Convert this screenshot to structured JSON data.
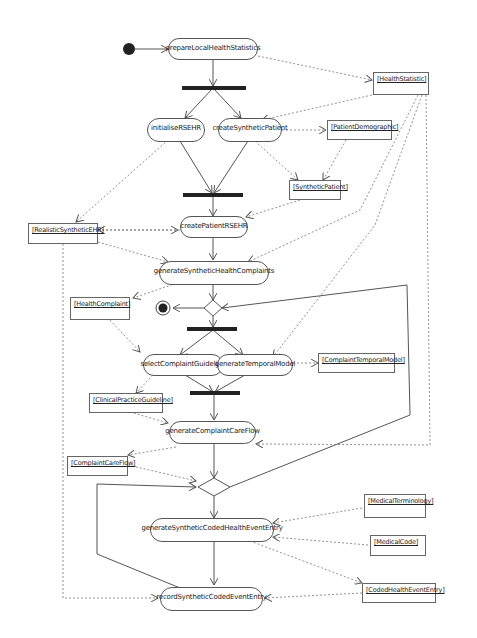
{
  "diagram": {
    "type": "UML activity diagram",
    "actions": [
      {
        "id": "prepareLocalHealthStatistics",
        "label": "prepareLocalHealthStatistics"
      },
      {
        "id": "initialiseRSEHR",
        "label": "initialiseRSEHR"
      },
      {
        "id": "createSyntheticPatient",
        "label": "createSyntheticPatient"
      },
      {
        "id": "createPatientRSEHR",
        "label": "createPatientRSEHR"
      },
      {
        "id": "generateSyntheticHealthComplaints",
        "label": "generateSyntheticHealthComplaints"
      },
      {
        "id": "selectComplaintGuideline",
        "label": "selectComplaintGuideline"
      },
      {
        "id": "generateTemporalModel",
        "label": "generateTemporalModel"
      },
      {
        "id": "generateComplaintCareFlow",
        "label": "generateComplaintCareFlow"
      },
      {
        "id": "generateSyntheticCodedHealthEventEntry",
        "label": "generateSyntheticCodedHealthEventEntry"
      },
      {
        "id": "recordSyntheticCodedEventEntry",
        "label": "recordSyntheticCodedEventEntry"
      }
    ],
    "objects": [
      {
        "id": "HealthStatistic",
        "label": "[HealthStatistic]"
      },
      {
        "id": "PatientDemographic",
        "label": "[PatientDemographic]"
      },
      {
        "id": "SyntheticPatient",
        "label": "[SyntheticPatient]"
      },
      {
        "id": "RealisticSyntheticEHR",
        "label": "[RealisticSyntheticEHR]"
      },
      {
        "id": "HealthComplaint",
        "label": "[HealthComplaint]"
      },
      {
        "id": "ComplaintTemporalModel",
        "label": "[ComplaintTemporalModel]"
      },
      {
        "id": "ClinicalPracticeGuideline",
        "label": "[ClinicalPracticeGuideline]"
      },
      {
        "id": "ComplaintCareFlow",
        "label": "[ComplaintCareFlow]"
      },
      {
        "id": "MedicalTerminology",
        "label": "[MedicalTerminology]"
      },
      {
        "id": "MedicalCode",
        "label": "[MedicalCode]"
      },
      {
        "id": "CodedHealthEventEntry",
        "label": "[CodedHealthEventEntry]"
      }
    ],
    "control_nodes": [
      "initial-node",
      "fork-1",
      "join-1",
      "decision-1",
      "final-node",
      "fork-2",
      "join-2",
      "decision-2"
    ],
    "colors": {
      "line": "#555555",
      "bar": "#222222",
      "node_fill": "#ffffff"
    }
  }
}
